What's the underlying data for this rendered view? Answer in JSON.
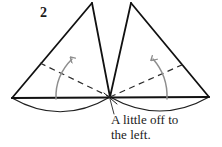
{
  "figure": {
    "name": "paper-folding-step-diagram",
    "step_number": "2",
    "caption_lines": [
      "A little off to",
      "the left."
    ],
    "caption_text": "A little off to the left.",
    "colors": {
      "ink": "#1a1a1a",
      "outline": "#111111",
      "dashed_guide": "#2b2b2b",
      "motion_arrow": "#8e8e8e",
      "leader_line": "#3a3a3a",
      "background": "#ffffff"
    },
    "stroke_widths": {
      "cone_outline": 1.7,
      "base_line": 2.0,
      "ellipse": 1.2,
      "dashed": 1.2,
      "motion_arrow": 1.4,
      "leader": 1.0
    },
    "shapes": {
      "left_cone": {
        "label": "left-cone",
        "apex": [
          92,
          3
        ],
        "base_left": [
          12,
          98
        ],
        "base_right": [
          110,
          97
        ],
        "ellipse_dip": 22
      },
      "right_cone": {
        "label": "right-cone",
        "apex": [
          131,
          3
        ],
        "base_left": [
          110,
          97
        ],
        "base_right": [
          209,
          97
        ],
        "ellipse_dip": 22
      },
      "crossing_point": [
        110,
        97
      ]
    },
    "dashed_guides": [
      {
        "label": "left-radius-guide",
        "from": [
          40,
          63
        ],
        "to": [
          110,
          97
        ]
      },
      {
        "label": "right-radius-guide",
        "from": [
          110,
          97
        ],
        "to": [
          184,
          64
        ]
      }
    ],
    "motion_arrows": [
      {
        "label": "left-rotation-arrow",
        "direction": "up-right",
        "tail": [
          56,
          99
        ],
        "tip": [
          73,
          58
        ]
      },
      {
        "label": "right-rotation-arrow",
        "direction": "up-left",
        "tail": [
          167,
          99
        ],
        "tip": [
          152,
          58
        ]
      }
    ],
    "leader_line": {
      "label": "caption-leader",
      "from": [
        110,
        97
      ],
      "to": [
        114,
        113
      ]
    }
  }
}
